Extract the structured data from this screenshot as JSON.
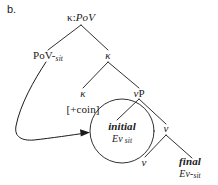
{
  "figure": {
    "panel_label": "b.",
    "type": "syntactic-tree-diagram",
    "ink_color": "#1a1a1a",
    "background_color": "#ffffff"
  },
  "nodes": {
    "root": {
      "label": "κ:PoV",
      "kappa": "κ",
      "sep": ":",
      "pov": "PoV"
    },
    "pov_sit": {
      "base": "PoV-",
      "subscript": "sit"
    },
    "kappa_mid": {
      "label": "κ"
    },
    "kappa_leaf": {
      "label": "κ"
    },
    "coin_feature": {
      "label": "[+coin]"
    },
    "vp": {
      "italic_v": "v",
      "p": "P"
    },
    "v_mid": {
      "label": "v"
    },
    "v_leaf": {
      "label": "v"
    },
    "initial_event": {
      "line1": "initial",
      "line2_base": "Ev",
      "line2_sub": "sit"
    },
    "final_event": {
      "line1": "final",
      "line2_base": "Ev-",
      "line2_sub": "sit"
    }
  },
  "annotations": {
    "movement_arrow": "curved-arrow-from-pov-sit-to-initial-event",
    "circle": "circle-around-initial-event-node"
  }
}
